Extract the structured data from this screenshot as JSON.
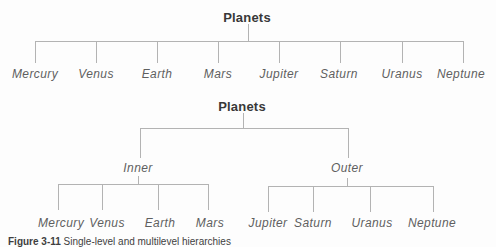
{
  "page": {
    "background": "#fdfdfd",
    "line_color": "#b3b3b3",
    "title_color": "#383838",
    "label_color": "#5f5f5f"
  },
  "trees": [
    {
      "root": "Planets",
      "children": [
        "Mercury",
        "Venus",
        "Earth",
        "Mars",
        "Jupiter",
        "Saturn",
        "Uranus",
        "Neptune"
      ]
    },
    {
      "root": "Planets",
      "groups": [
        {
          "label": "Inner",
          "children": [
            "Mercury",
            "Venus",
            "Earth",
            "Mars"
          ]
        },
        {
          "label": "Outer",
          "children": [
            "Jupiter",
            "Saturn",
            "Uranus",
            "Neptune"
          ]
        }
      ]
    }
  ],
  "caption": {
    "figure_label": "Figure 3-11",
    "text": "Single-level and multilevel hierarchies"
  }
}
